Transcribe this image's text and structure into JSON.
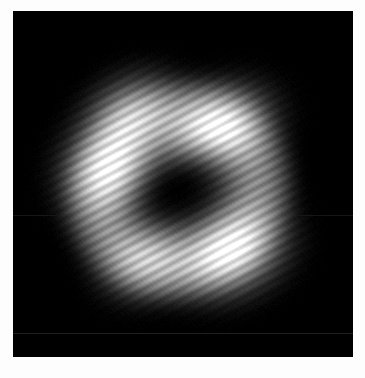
{
  "figure": {
    "title": "grayscale-interference-micrograph",
    "description": "Monochrome scientific image of an annular bright structure with a dark central core and diagonal interference fringes on a near-black background.",
    "domain_note": "natural-image"
  },
  "canvas": {
    "width": 365,
    "height": 378,
    "background_color": "#fdfdfd",
    "border_color": "#ffffff"
  },
  "image_area": {
    "name": "image-frame",
    "x": 13,
    "y": 11,
    "width": 340,
    "height": 346,
    "background_color": "#050505",
    "colormap": "grayscale",
    "min_gray": "#000000",
    "max_gray": "#ffffff"
  },
  "structure": {
    "type": "annulus",
    "center_x": 178,
    "center_y": 190,
    "outer_radius": 116,
    "inner_radius": 44,
    "ring_peak_radius": 78,
    "rotation_deg": -28,
    "ellipse_aspect": 0.94
  },
  "dark_core": {
    "name": "central-dark-core",
    "center_x": 177,
    "center_y": 188,
    "radius_x": 52,
    "radius_y": 33,
    "rotation_deg": -30,
    "gray_level": 18
  },
  "bright_lobes": [
    {
      "name": "lobe-upper-right",
      "center_x": 215,
      "center_y": 133,
      "radius_x": 46,
      "radius_y": 33,
      "rotation_deg": -30,
      "peak_gray": 255,
      "intensity": 1.0
    },
    {
      "name": "lobe-left",
      "center_x": 113,
      "center_y": 172,
      "radius_x": 40,
      "radius_y": 37,
      "rotation_deg": -20,
      "peak_gray": 225,
      "intensity": 0.86
    },
    {
      "name": "lobe-lower-right",
      "center_x": 232,
      "center_y": 251,
      "radius_x": 44,
      "radius_y": 34,
      "rotation_deg": -25,
      "peak_gray": 240,
      "intensity": 0.92
    },
    {
      "name": "lobe-upper-left-arc",
      "center_x": 128,
      "center_y": 113,
      "radius_x": 40,
      "radius_y": 30,
      "rotation_deg": -35,
      "peak_gray": 170,
      "intensity": 0.58
    },
    {
      "name": "lobe-lower-left-arc",
      "center_x": 146,
      "center_y": 256,
      "radius_x": 40,
      "radius_y": 32,
      "rotation_deg": -30,
      "peak_gray": 150,
      "intensity": 0.5
    }
  ],
  "fringes": {
    "name": "diagonal-interference-fringes",
    "orientation_deg": 62,
    "period_px": 9.0,
    "amplitude": 0.17,
    "phase_deg": 0
  },
  "noise": {
    "name": "sensor-noise",
    "grain_amplitude": 7,
    "diagonal_texture_period_px": 5.5,
    "diagonal_texture_amplitude": 4
  },
  "artifacts": [
    {
      "name": "scanline-artifact-lower",
      "y": 333,
      "gray_level": 30,
      "thickness": 1
    },
    {
      "name": "scanline-artifact-upper",
      "y": 215,
      "gray_level": 22,
      "thickness": 1
    }
  ]
}
